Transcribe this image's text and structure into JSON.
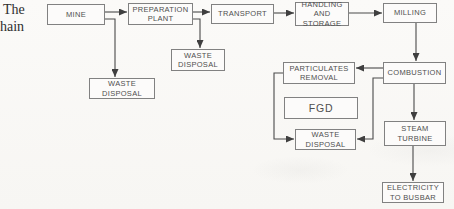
{
  "caption": {
    "line1": "The",
    "line2": "hain"
  },
  "diagram": {
    "type": "flowchart",
    "nodes": {
      "mine": {
        "label": "MINE"
      },
      "preparation_plant": {
        "label": "PREPARATION\nPLANT"
      },
      "transport": {
        "label": "TRANSPORT"
      },
      "handling_storage": {
        "label": "HANDLING\nAND\nSTORAGE"
      },
      "milling": {
        "label": "MILLING"
      },
      "waste_disposal_mine": {
        "label": "WASTE\nDISPOSAL"
      },
      "waste_disposal_prep": {
        "label": "WASTE\nDISPOSAL"
      },
      "particulates_removal": {
        "label": "PARTICULATES\nREMOVAL"
      },
      "combustion": {
        "label": "COMBUSTION"
      },
      "fgd": {
        "label": "FGD"
      },
      "waste_disposal_combustion": {
        "label": "WASTE\nDISPOSAL"
      },
      "steam_turbine": {
        "label": "STEAM\nTURBINE"
      },
      "electricity_busbar": {
        "label": "ELECTRICITY\nTO  BUSBAR"
      }
    },
    "edges": [
      {
        "from": "mine",
        "to": "preparation_plant"
      },
      {
        "from": "mine",
        "to": "waste_disposal_mine"
      },
      {
        "from": "preparation_plant",
        "to": "transport"
      },
      {
        "from": "preparation_plant",
        "to": "waste_disposal_prep"
      },
      {
        "from": "transport",
        "to": "handling_storage"
      },
      {
        "from": "handling_storage",
        "to": "milling"
      },
      {
        "from": "milling",
        "to": "combustion"
      },
      {
        "from": "combustion",
        "to": "particulates_removal"
      },
      {
        "from": "particulates_removal",
        "to": "waste_disposal_combustion"
      },
      {
        "from": "combustion",
        "to": "waste_disposal_combustion"
      },
      {
        "from": "combustion",
        "to": "steam_turbine"
      },
      {
        "from": "steam_turbine",
        "to": "electricity_busbar"
      }
    ],
    "colors": {
      "line": "#4a4a4a",
      "box_border": "#818181",
      "box_fill": "#fcfbfa",
      "text": "#4f4f4f",
      "background": "#fbfaf8"
    }
  }
}
